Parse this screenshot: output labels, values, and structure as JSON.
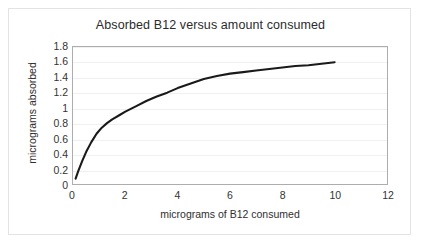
{
  "chart_data": {
    "type": "line",
    "title": "Absorbed B12 versus amount consumed",
    "xlabel": "micrograms of B12 consumed",
    "ylabel": "micrograms absorbed",
    "xlim": [
      0,
      12
    ],
    "ylim": [
      0,
      1.8
    ],
    "xticks": [
      "0",
      "2",
      "4",
      "6",
      "8",
      "10",
      "12"
    ],
    "xtick_values": [
      0,
      2,
      4,
      6,
      8,
      10,
      12
    ],
    "yticks": [
      "0",
      "0.2",
      "0.4",
      "0.6",
      "0.8",
      "1",
      "1.2",
      "1.4",
      "1.6",
      "1.8"
    ],
    "ytick_values": [
      0,
      0.2,
      0.4,
      0.6,
      0.8,
      1,
      1.2,
      1.4,
      1.6,
      1.8
    ],
    "grid": "horizontal",
    "legend": "none",
    "line_color": "#1a1a1a",
    "grid_color": "#f0f0f0",
    "frame_color": "#adadad",
    "background_color": "#ffffff",
    "series": [
      {
        "name": "absorbed B12",
        "x": [
          0.1,
          0.2,
          0.35,
          0.5,
          0.7,
          0.9,
          1.1,
          1.3,
          1.5,
          1.8,
          2.0,
          2.4,
          2.8,
          3.2,
          3.6,
          4.0,
          4.5,
          5.0,
          5.5,
          6.0,
          6.5,
          7.0,
          7.5,
          8.0,
          8.5,
          9.0,
          9.5,
          10.0
        ],
        "y": [
          0.07,
          0.17,
          0.3,
          0.42,
          0.55,
          0.66,
          0.74,
          0.8,
          0.85,
          0.91,
          0.95,
          1.02,
          1.09,
          1.15,
          1.2,
          1.26,
          1.32,
          1.38,
          1.42,
          1.45,
          1.47,
          1.49,
          1.51,
          1.53,
          1.55,
          1.56,
          1.58,
          1.6
        ]
      }
    ]
  }
}
